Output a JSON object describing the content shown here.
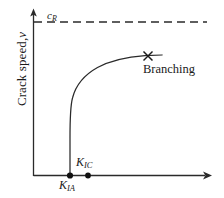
{
  "figure": {
    "background_color": "#ffffff",
    "line_color": "#2a2a2a",
    "axis_color": "#2a2a2a"
  },
  "axes": {
    "y_label": "Crack speed,",
    "y_label_symbol": "v",
    "x_label": "",
    "x_axis_name": "stress-intensity-factor-axis",
    "y_axis_name": "crack-speed-axis"
  },
  "annotations": {
    "rayleigh_speed_label": "c",
    "rayleigh_speed_sub": "R",
    "kic_label": "K",
    "kic_sub": "IC",
    "kia_label": "K",
    "kia_sub": "IA",
    "branching_label": "Branching"
  },
  "chart_data": {
    "type": "line",
    "title": "",
    "xlabel": "",
    "ylabel": "Crack speed, v",
    "xlim": [
      0,
      224
    ],
    "ylim": [
      0,
      198
    ],
    "grid": false,
    "legend": null,
    "series": [
      {
        "name": "crack-speed-curve",
        "comment": "Crack speed vs stress intensity factor; near-vertical rise at K_IA then plateau approaching c_R",
        "points": [
          [
            70,
            175
          ],
          [
            70,
            150
          ],
          [
            70,
            130
          ],
          [
            70.5,
            112
          ],
          [
            72,
            100
          ],
          [
            76,
            88
          ],
          [
            83,
            78
          ],
          [
            93,
            70
          ],
          [
            106,
            64
          ],
          [
            120,
            60
          ],
          [
            134,
            57.5
          ],
          [
            148,
            56
          ],
          [
            162,
            55.5
          ]
        ]
      }
    ],
    "reference_lines": [
      {
        "name": "rayleigh-wave-speed-asymptote",
        "label": "c_R",
        "style": "dashed",
        "orientation": "horizontal",
        "y": 22,
        "x_start": 34,
        "x_end": 207
      }
    ],
    "markers": [
      {
        "name": "kia-point",
        "label": "K_IA",
        "shape": "dot",
        "x": 70,
        "y": 175.5
      },
      {
        "name": "kic-point",
        "label": "K_IC",
        "shape": "dot",
        "x": 88,
        "y": 175.5
      },
      {
        "name": "branching-point",
        "label": "Branching",
        "shape": "cross",
        "x": 148,
        "y": 56
      }
    ]
  }
}
